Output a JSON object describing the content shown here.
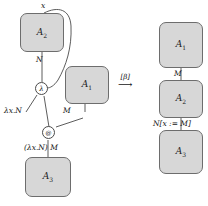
{
  "figure": {
    "colors": {
      "box_fill": "#d7d7d7",
      "box_stroke": "#6d6d6d",
      "edge_stroke": "#4a4a4a",
      "text": "#151515",
      "background": "#ffffff"
    }
  },
  "left_graph": {
    "boxes": [
      {
        "label": "A",
        "sub": "2",
        "name": "box-a2-top-left"
      },
      {
        "label": "A",
        "sub": "1",
        "name": "box-a1-middle-left"
      },
      {
        "label": "A",
        "sub": "3",
        "name": "box-a3-bottom-left"
      }
    ],
    "edge_labels": [
      {
        "text": "x",
        "name": "edge-label-x"
      },
      {
        "text": "N",
        "name": "edge-label-n"
      },
      {
        "text": "M",
        "name": "edge-label-m"
      }
    ],
    "nodes": [
      {
        "glyph": "λ",
        "name": "lambda-node"
      },
      {
        "glyph": "@",
        "name": "application-node"
      }
    ],
    "terms": [
      {
        "text": "λx.N",
        "name": "term-lambda-x-n"
      },
      {
        "text": "(λx.N) M",
        "name": "term-redex"
      }
    ]
  },
  "reduction_arrow": {
    "tag": "[β]",
    "shaft": "⟶"
  },
  "right_graph": {
    "boxes": [
      {
        "label": "A",
        "sub": "1",
        "name": "box-a1-top-right"
      },
      {
        "label": "A",
        "sub": "2",
        "name": "box-a2-middle-right"
      },
      {
        "label": "A",
        "sub": "3",
        "name": "box-a3-bottom-right"
      }
    ],
    "edge_labels": [
      {
        "text": "M",
        "name": "edge-label-m-right"
      },
      {
        "text": "N[x := M]",
        "name": "edge-label-substitution"
      }
    ]
  }
}
